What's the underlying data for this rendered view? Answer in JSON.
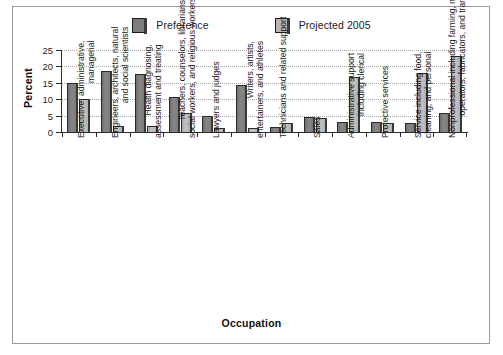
{
  "chart_data": {
    "type": "bar",
    "title": "",
    "xlabel": "Occupation",
    "ylabel": "Percent",
    "ylim": [
      0,
      25
    ],
    "yticks": [
      0,
      5,
      10,
      15,
      20,
      25
    ],
    "grid": "horizontal-dotted",
    "legend_position": "top-center",
    "categories": [
      "Executive, administrative, managerial",
      "Engineers, architects, natural and social scientists",
      "Health diagnosing, assessment and treating",
      "Teachers, counselors, librarians, social workers, and religious workers",
      "Lawyers and judges",
      "Writers, artists, entertainers, and athletes",
      "Technicians and related support",
      "Sales",
      "Administrative support including clerical",
      "Protective services",
      "Service including food, cleaning, and personal",
      "Nonprofessional including farming, mechanics, operators, fabricators, and transportation"
    ],
    "category_lines": [
      [
        "Executive, administrative,",
        "managerial"
      ],
      [
        "Engineers, architects, natural",
        "and social scientists"
      ],
      [
        "Health diagnosing,",
        "assessment and treating"
      ],
      [
        "Teachers, counselors, librarians,",
        "social workers, and religious workers"
      ],
      [
        "Lawyers and judges"
      ],
      [
        "Writers, artists,",
        "entertainers, and athletes"
      ],
      [
        "Technicians and related support"
      ],
      [
        "Sales"
      ],
      [
        "Administrative support",
        "including clerical"
      ],
      [
        "Protective services"
      ],
      [
        "Service including food,",
        "cleaning, and personal"
      ],
      [
        "Nonprofessional including farming, mechanics,",
        "operators, fabricators, and transportation"
      ]
    ],
    "series": [
      {
        "name": "Preference",
        "color": "#7d7d7d",
        "values": [
          15.0,
          18.5,
          17.8,
          10.7,
          4.9,
          14.2,
          1.5,
          4.7,
          3.1,
          3.1,
          2.6,
          5.8
        ]
      },
      {
        "name": "Projected 2005",
        "color": "#b4b4b4",
        "values": [
          10.0,
          1.8,
          1.7,
          5.8,
          1.2,
          1.2,
          2.9,
          4.3,
          16.9,
          2.7,
          18.1,
          23.1
        ]
      }
    ]
  },
  "legend": {
    "items": [
      {
        "label": "Preference"
      },
      {
        "label": "Projected 2005"
      }
    ]
  },
  "axes": {
    "y_title": "Percent",
    "x_title": "Occupation",
    "y_ticks": [
      "0",
      "5",
      "10",
      "15",
      "20",
      "25"
    ]
  }
}
